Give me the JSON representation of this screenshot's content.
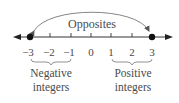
{
  "diagram": {
    "title": "Opposites",
    "number_line": {
      "ticks": [
        "−3",
        "−2",
        "−1",
        "0",
        "1",
        "2",
        "3"
      ],
      "highlighted_points": [
        "−3",
        "3"
      ]
    },
    "groups": {
      "negative": {
        "line1": "Negative",
        "line2": "integers"
      },
      "positive": {
        "line1": "Positive",
        "line2": "integers"
      }
    },
    "colors": {
      "line": "#333333",
      "text": "#4a4a4a",
      "arc": "#666666"
    }
  }
}
